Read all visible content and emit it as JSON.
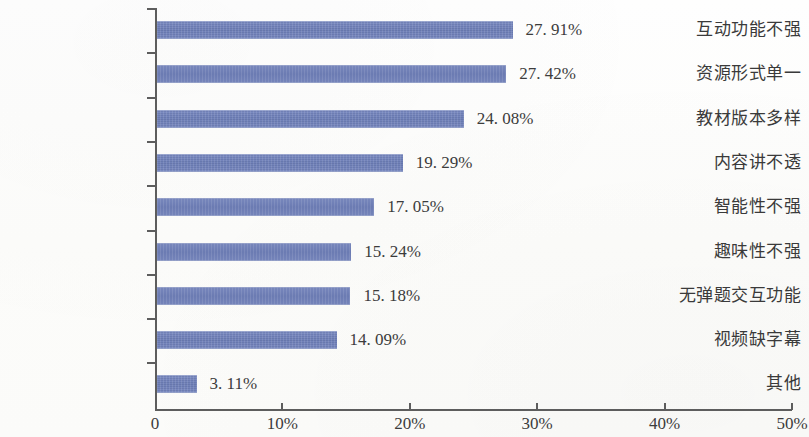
{
  "chart_data": {
    "type": "bar",
    "orientation": "horizontal",
    "title": "",
    "subtitle": "",
    "xlabel": "",
    "ylabel": "",
    "xlim": [
      0,
      50
    ],
    "grid": false,
    "legend": null,
    "categories": [
      "互动功能不强",
      "资源形式单一",
      "教材版本多样",
      "内容讲不透",
      "智能性不强",
      "趣味性不强",
      "无弹题交互功能",
      "视频缺字幕",
      "其他"
    ],
    "values": [
      27.91,
      27.42,
      24.08,
      19.29,
      17.05,
      15.24,
      15.18,
      14.09,
      3.11
    ],
    "value_labels": [
      "27. 91%",
      "27. 42%",
      "24. 08%",
      "19. 29%",
      "17. 05%",
      "15. 24%",
      "15. 18%",
      "14. 09%",
      "3. 11%"
    ],
    "xticks": [
      0,
      10,
      20,
      30,
      40,
      50
    ],
    "xtick_labels": [
      "0",
      "10%",
      "20%",
      "30%",
      "40%",
      "50%"
    ],
    "series": [
      {
        "name": "占比",
        "values": [
          27.91,
          27.42,
          24.08,
          19.29,
          17.05,
          15.24,
          15.18,
          14.09,
          3.11
        ],
        "color": "#6e80b9"
      }
    ],
    "colors": {
      "bar": "#6e80b9",
      "axis": "#5d5d5d",
      "text": "#3c3c3c",
      "background": "#fdfdfb"
    }
  }
}
